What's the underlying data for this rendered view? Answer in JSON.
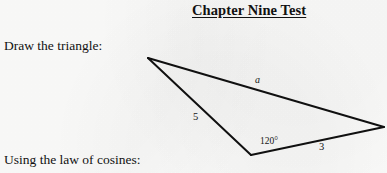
{
  "document": {
    "title": "Chapter Nine Test",
    "background_color": "#fdfdfc",
    "ink_color": "#111111"
  },
  "prompts": {
    "draw": "Draw the triangle:",
    "law_of_cosines": "Using the law of cosines:"
  },
  "figure": {
    "name": "triangle-figure",
    "shape": "triangle",
    "stroke_color": "#101010",
    "stroke_width": 2,
    "vertices": {
      "apex_left": {
        "x": 148,
        "y": 58
      },
      "bottom": {
        "x": 251,
        "y": 155
      },
      "right": {
        "x": 384,
        "y": 127
      }
    },
    "labels": {
      "side_a": "a",
      "side_5": "5",
      "angle": "120°",
      "side_3": "3"
    }
  }
}
